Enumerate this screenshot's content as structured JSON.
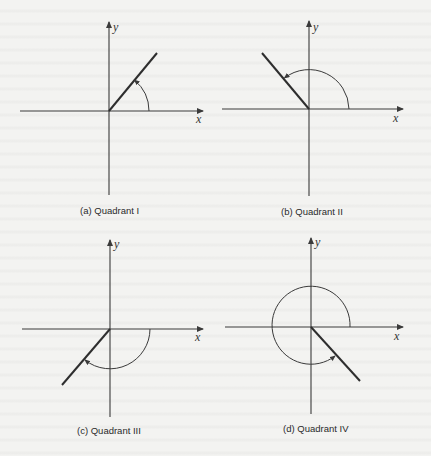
{
  "figure": {
    "panels": [
      {
        "id": "a",
        "caption": "(a)  Quadrant I",
        "x_label": "x",
        "y_label": "y",
        "quadrant": "I",
        "origin": [
          109,
          111
        ],
        "terminal_end": [
          157,
          53
        ],
        "arc": "counterclockwise from positive x-axis to terminal side"
      },
      {
        "id": "b",
        "caption": "(b)  Quadrant II",
        "x_label": "x",
        "y_label": "y",
        "quadrant": "II",
        "origin": [
          309,
          109
        ],
        "terminal_end": [
          262,
          53
        ],
        "arc": "counterclockwise from positive x-axis to terminal side"
      },
      {
        "id": "c",
        "caption": "(c)  Quadrant III",
        "x_label": "x",
        "y_label": "y",
        "quadrant": "III",
        "origin": [
          110,
          329
        ],
        "terminal_end": [
          62,
          385
        ],
        "arc": "clockwise from positive x-axis to terminal side"
      },
      {
        "id": "d",
        "caption": "(d)  Quadrant IV",
        "x_label": "x",
        "y_label": "y",
        "quadrant": "IV",
        "origin": [
          311,
          327
        ],
        "terminal_end": [
          360,
          381
        ],
        "arc": "counterclockwise more than one half-turn from positive x-axis to terminal side"
      }
    ],
    "colors": {
      "background": "#f3f3f1",
      "line": "#3a3a3a",
      "terminal_side": "#2e2e2e"
    }
  }
}
